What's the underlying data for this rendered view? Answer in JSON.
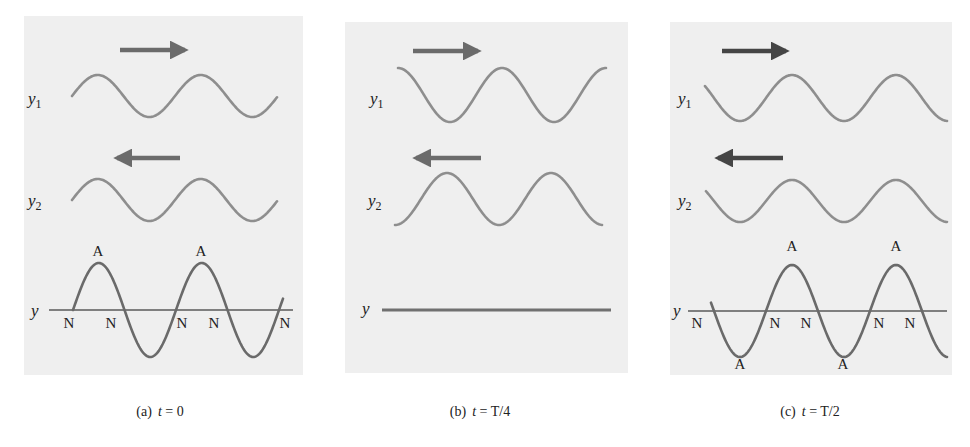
{
  "figure": {
    "colors": {
      "panel_background": "#efefef",
      "component_wave": "#8e8e8e",
      "resultant_wave": "#6a6a6a",
      "arrow_light": "#6b6b6b",
      "arrow_dark": "#454545",
      "axis": "#5a5a5a",
      "text": "#222222"
    },
    "panels": [
      {
        "id": "a",
        "caption": {
          "letter": "(a)",
          "t_var": "t",
          "eq": " = 0"
        },
        "caption_x": 160,
        "box": {
          "x": 24,
          "y": 16,
          "w": 279,
          "h": 359
        },
        "arrow_color": "#6b6b6b",
        "arrow_right": {
          "x1": 120,
          "x2": 185,
          "y": 50
        },
        "arrow_left": {
          "x1": 180,
          "x2": 117,
          "y": 158
        },
        "y1": {
          "label": "y",
          "sub": "1",
          "label_x": 28,
          "label_y": 104,
          "wave": {
            "x0": 72,
            "x1": 277,
            "center": 96,
            "amp": 21,
            "period": 103,
            "phase_x": 72,
            "shape": "sin"
          }
        },
        "y2": {
          "label": "y",
          "sub": "2",
          "label_x": 28,
          "label_y": 206,
          "wave": {
            "x0": 72,
            "x1": 277,
            "center": 200,
            "amp": 21,
            "period": 103,
            "phase_x": 72,
            "shape": "sin"
          }
        },
        "y": {
          "label": "y",
          "label_x": 31,
          "label_y": 316,
          "axis": {
            "x1": 49,
            "x2": 293,
            "y": 310
          },
          "flat": false,
          "wave": {
            "x0": 73,
            "x1": 283,
            "center": 310,
            "amp": 47,
            "period": 103,
            "phase_x": 73,
            "shape": "sin"
          },
          "antinodes": [
            {
              "text": "A",
              "x": 98,
              "y": 256
            },
            {
              "text": "A",
              "x": 201,
              "y": 256
            }
          ],
          "nodes": [
            {
              "text": "N",
              "x": 69,
              "y": 328
            },
            {
              "text": "N",
              "x": 111,
              "y": 328
            },
            {
              "text": "N",
              "x": 182,
              "y": 328
            },
            {
              "text": "N",
              "x": 214,
              "y": 328
            },
            {
              "text": "N",
              "x": 285,
              "y": 328
            }
          ]
        }
      },
      {
        "id": "b",
        "caption": {
          "letter": "(b)",
          "t_var": "t",
          "eq": " = T/4"
        },
        "caption_x": 480,
        "box": {
          "x": 345,
          "y": 22,
          "w": 283,
          "h": 351
        },
        "arrow_color": "#6b6b6b",
        "arrow_right": {
          "x1": 413,
          "x2": 478,
          "y": 51
        },
        "arrow_left": {
          "x1": 481,
          "x2": 416,
          "y": 158
        },
        "y1": {
          "label": "y",
          "sub": "1",
          "label_x": 370,
          "label_y": 104,
          "wave": {
            "x0": 398,
            "x1": 606,
            "center": 95,
            "amp": 27,
            "period": 104,
            "phase_x": 398,
            "shape": "cos"
          }
        },
        "y2": {
          "label": "y",
          "sub": "2",
          "label_x": 368,
          "label_y": 206,
          "wave": {
            "x0": 395,
            "x1": 602,
            "center": 199,
            "amp": 26,
            "period": 104,
            "phase_x": 395,
            "shape": "-cos"
          }
        },
        "y": {
          "label": "y",
          "label_x": 362,
          "label_y": 314,
          "axis": {
            "x1": 382,
            "x2": 611,
            "y": 310
          },
          "flat": true,
          "antinodes": [],
          "nodes": []
        }
      },
      {
        "id": "c",
        "caption": {
          "letter": "(c)",
          "t_var": "t",
          "eq": " = T/2"
        },
        "caption_x": 810,
        "box": {
          "x": 670,
          "y": 22,
          "w": 282,
          "h": 353
        },
        "arrow_color": "#454545",
        "arrow_right": {
          "x1": 722,
          "x2": 786,
          "y": 51
        },
        "arrow_left": {
          "x1": 783,
          "x2": 718,
          "y": 158
        },
        "y1": {
          "label": "y",
          "sub": "1",
          "label_x": 678,
          "label_y": 104,
          "wave": {
            "x0": 705,
            "x1": 947,
            "center": 98,
            "amp": 23,
            "period": 104,
            "phase_x": 740,
            "shape": "trough"
          }
        },
        "y2": {
          "label": "y",
          "sub": "2",
          "label_x": 678,
          "label_y": 206,
          "wave": {
            "x0": 706,
            "x1": 947,
            "center": 201,
            "amp": 21,
            "period": 104,
            "phase_x": 740,
            "shape": "trough"
          }
        },
        "y": {
          "label": "y",
          "label_x": 673,
          "label_y": 316,
          "axis": {
            "x1": 688,
            "x2": 947,
            "y": 311
          },
          "flat": false,
          "wave": {
            "x0": 711,
            "x1": 947,
            "center": 301,
            "amp": 46,
            "period": 104,
            "phase_x": 740,
            "shape": "trough"
          },
          "antinodes": [
            {
              "text": "A",
              "x": 792,
              "y": 251
            },
            {
              "text": "A",
              "x": 896,
              "y": 251
            },
            {
              "text": "A",
              "x": 740,
              "y": 369
            },
            {
              "text": "A",
              "x": 843,
              "y": 369
            }
          ],
          "nodes": [
            {
              "text": "N",
              "x": 697,
              "y": 328
            },
            {
              "text": "N",
              "x": 775,
              "y": 328
            },
            {
              "text": "N",
              "x": 806,
              "y": 328
            },
            {
              "text": "N",
              "x": 879,
              "y": 328
            },
            {
              "text": "N",
              "x": 910,
              "y": 328
            }
          ]
        }
      }
    ],
    "caption_y": 416
  }
}
